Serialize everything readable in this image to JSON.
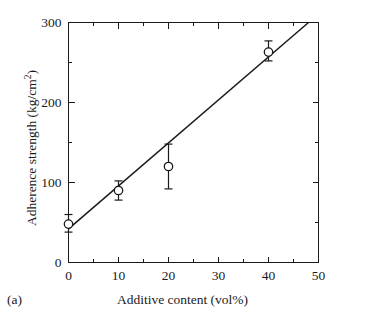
{
  "panel": {
    "label": "(a)"
  },
  "chart_data": {
    "type": "scatter",
    "title": "",
    "xlabel": "Additive content (vol%)",
    "ylabel": "Adherence strength (kg/cm",
    "ylabel_superscript": "2",
    "ylabel_suffix": ")",
    "xlim": [
      0,
      50
    ],
    "ylim": [
      0,
      300
    ],
    "x_ticks_major": [
      0,
      10,
      20,
      30,
      40,
      50
    ],
    "x_tick_labels": [
      "0",
      "10",
      "20",
      "30",
      "40",
      "50"
    ],
    "x_ticks_minor": [
      5,
      15,
      25,
      35,
      45
    ],
    "y_ticks_major": [
      0,
      100,
      200,
      300
    ],
    "y_tick_labels": [
      "0",
      "100",
      "200",
      "300"
    ],
    "y_ticks_minor": [
      50,
      150,
      250
    ],
    "grid": false,
    "legend": "none",
    "marker_style": "open-circle",
    "points": [
      {
        "x": 0,
        "y": 48,
        "err_low": 38,
        "err_high": 60
      },
      {
        "x": 10,
        "y": 90,
        "err_low": 78,
        "err_high": 102
      },
      {
        "x": 20,
        "y": 120,
        "err_low": 92,
        "err_high": 148
      },
      {
        "x": 40,
        "y": 263,
        "err_low": 252,
        "err_high": 277
      }
    ],
    "fit_line": {
      "type": "linear",
      "x_start": 0,
      "y_start": 42,
      "x_end": 48,
      "y_end": 300
    },
    "colors": {
      "axis": "#1a1a1a",
      "line": "#1a1a1a",
      "marker_fill": "#ffffff",
      "marker_stroke": "#1a1a1a",
      "background": "#ffffff"
    }
  }
}
